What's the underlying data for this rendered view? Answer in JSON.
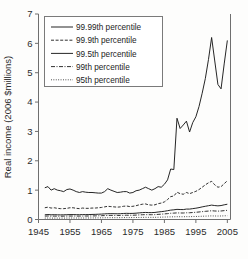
{
  "chart_data": {
    "type": "line",
    "title": "",
    "xlabel": "",
    "ylabel": "Real income (2006 $millions)",
    "xlim": [
      1945,
      2006
    ],
    "ylim": [
      0,
      7
    ],
    "grid": false,
    "legend_position": "top-left-inside",
    "xticks": [
      "1945",
      "1955",
      "1965",
      "1975",
      "1985",
      "1995",
      "2005"
    ],
    "xtick_values": [
      1945,
      1955,
      1965,
      1975,
      1985,
      1995,
      2005
    ],
    "yticks": [
      "0",
      "1",
      "2",
      "3",
      "4",
      "5",
      "6",
      "7"
    ],
    "ytick_values": [
      0,
      1,
      2,
      3,
      4,
      5,
      6,
      7
    ],
    "x": [
      1947,
      1948,
      1949,
      1950,
      1951,
      1952,
      1953,
      1954,
      1955,
      1956,
      1957,
      1958,
      1959,
      1960,
      1961,
      1962,
      1963,
      1964,
      1965,
      1966,
      1967,
      1968,
      1969,
      1970,
      1971,
      1972,
      1973,
      1974,
      1975,
      1976,
      1977,
      1978,
      1979,
      1980,
      1981,
      1982,
      1983,
      1984,
      1985,
      1986,
      1987,
      1988,
      1989,
      1990,
      1991,
      1992,
      1993,
      1994,
      1995,
      1996,
      1997,
      1998,
      1999,
      2000,
      2001,
      2002,
      2003,
      2004,
      2005
    ],
    "series": [
      {
        "name": "99.99th percentile",
        "style": "solid",
        "values": [
          1.08,
          1.12,
          1.0,
          1.05,
          1.0,
          0.98,
          0.95,
          1.02,
          1.04,
          1.0,
          0.95,
          0.92,
          0.95,
          0.93,
          0.92,
          0.92,
          0.91,
          0.9,
          0.9,
          0.95,
          1.05,
          1.0,
          0.96,
          0.92,
          0.93,
          0.95,
          0.95,
          0.9,
          0.92,
          0.98,
          1.0,
          1.05,
          1.1,
          1.05,
          1.0,
          1.05,
          1.12,
          1.1,
          1.2,
          1.35,
          1.72,
          1.7,
          3.45,
          3.1,
          3.22,
          3.35,
          2.98,
          3.3,
          3.5,
          3.85,
          4.3,
          4.8,
          5.45,
          6.2,
          5.4,
          4.6,
          4.45,
          5.3,
          6.1
        ]
      },
      {
        "name": "99.9th percentile",
        "style": "dashed",
        "values": [
          0.4,
          0.42,
          0.39,
          0.4,
          0.38,
          0.37,
          0.37,
          0.38,
          0.4,
          0.4,
          0.38,
          0.37,
          0.39,
          0.38,
          0.38,
          0.39,
          0.39,
          0.4,
          0.41,
          0.43,
          0.45,
          0.44,
          0.43,
          0.42,
          0.43,
          0.45,
          0.46,
          0.44,
          0.45,
          0.47,
          0.5,
          0.52,
          0.53,
          0.5,
          0.49,
          0.5,
          0.54,
          0.56,
          0.6,
          0.68,
          0.78,
          0.8,
          0.93,
          0.88,
          0.86,
          0.92,
          0.88,
          0.92,
          0.96,
          1.02,
          1.1,
          1.18,
          1.25,
          1.3,
          1.18,
          1.1,
          1.12,
          1.22,
          1.32
        ]
      },
      {
        "name": "99.5th percentile",
        "style": "solid",
        "values": [
          0.16,
          0.17,
          0.16,
          0.165,
          0.16,
          0.158,
          0.16,
          0.163,
          0.168,
          0.168,
          0.165,
          0.163,
          0.168,
          0.167,
          0.168,
          0.172,
          0.175,
          0.18,
          0.185,
          0.192,
          0.198,
          0.2,
          0.198,
          0.196,
          0.198,
          0.205,
          0.21,
          0.206,
          0.208,
          0.215,
          0.225,
          0.235,
          0.24,
          0.235,
          0.235,
          0.24,
          0.255,
          0.268,
          0.28,
          0.3,
          0.32,
          0.33,
          0.345,
          0.34,
          0.338,
          0.355,
          0.355,
          0.37,
          0.385,
          0.405,
          0.43,
          0.45,
          0.47,
          0.49,
          0.475,
          0.465,
          0.475,
          0.5,
          0.52
        ]
      },
      {
        "name": "99th percentile",
        "style": "dashdot",
        "values": [
          0.115,
          0.12,
          0.113,
          0.116,
          0.113,
          0.112,
          0.113,
          0.115,
          0.118,
          0.118,
          0.116,
          0.115,
          0.118,
          0.118,
          0.119,
          0.121,
          0.123,
          0.126,
          0.13,
          0.134,
          0.138,
          0.14,
          0.139,
          0.138,
          0.139,
          0.143,
          0.146,
          0.144,
          0.145,
          0.15,
          0.156,
          0.162,
          0.166,
          0.163,
          0.163,
          0.166,
          0.174,
          0.182,
          0.19,
          0.2,
          0.212,
          0.218,
          0.225,
          0.222,
          0.221,
          0.23,
          0.23,
          0.238,
          0.246,
          0.256,
          0.268,
          0.278,
          0.288,
          0.298,
          0.29,
          0.285,
          0.29,
          0.302,
          0.312
        ]
      },
      {
        "name": "95th percentile",
        "style": "dotted",
        "values": [
          0.048,
          0.05,
          0.047,
          0.048,
          0.047,
          0.047,
          0.048,
          0.049,
          0.05,
          0.05,
          0.05,
          0.05,
          0.051,
          0.051,
          0.052,
          0.053,
          0.054,
          0.055,
          0.057,
          0.059,
          0.061,
          0.062,
          0.062,
          0.062,
          0.063,
          0.065,
          0.066,
          0.065,
          0.066,
          0.068,
          0.07,
          0.072,
          0.074,
          0.073,
          0.073,
          0.074,
          0.077,
          0.08,
          0.083,
          0.087,
          0.09,
          0.092,
          0.095,
          0.094,
          0.094,
          0.097,
          0.097,
          0.1,
          0.103,
          0.106,
          0.111,
          0.115,
          0.119,
          0.123,
          0.12,
          0.118,
          0.12,
          0.125,
          0.129
        ]
      }
    ]
  },
  "legend": {
    "items": [
      {
        "label": "99.99th percentile",
        "style": "solid"
      },
      {
        "label": "99.9th percentile",
        "style": "dashed"
      },
      {
        "label": "99.5th percentile",
        "style": "solid"
      },
      {
        "label": "99th percentile",
        "style": "dashdot"
      },
      {
        "label": "95th percentile",
        "style": "dotted"
      }
    ]
  },
  "colors": {
    "line": "#1a1a1a",
    "frame": "#6f6f6f",
    "text": "#2b2b2b",
    "background": "#fdfdfc"
  }
}
